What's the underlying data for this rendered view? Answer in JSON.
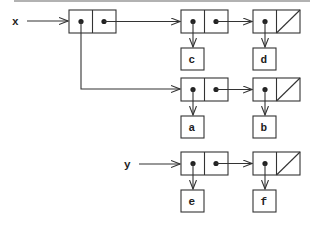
{
  "diagram": {
    "type": "box-and-pointer",
    "variables": [
      {
        "name": "x",
        "label": "x"
      },
      {
        "name": "y",
        "label": "y"
      }
    ],
    "leaves": [
      {
        "id": "c",
        "label": "c"
      },
      {
        "id": "d",
        "label": "d"
      },
      {
        "id": "a",
        "label": "a"
      },
      {
        "id": "b",
        "label": "b"
      },
      {
        "id": "e",
        "label": "e"
      },
      {
        "id": "f",
        "label": "f"
      }
    ],
    "structure": "x = ((a b) c d); y = (e f)",
    "colors": {
      "stroke": "#333333",
      "background": "#ffffff",
      "top_rule": "#888888"
    }
  }
}
